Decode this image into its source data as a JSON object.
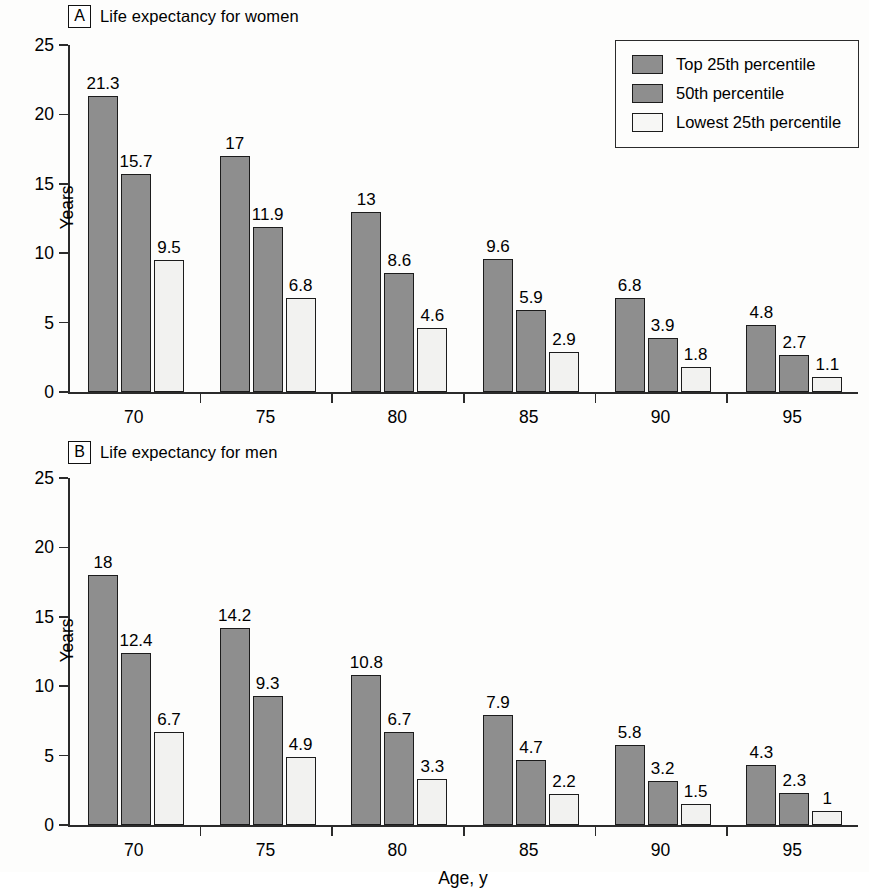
{
  "figure": {
    "background_color": "#fdfdfc",
    "axis_color": "#2b2b2b",
    "xlabel": "Age, y"
  },
  "legend": {
    "position": "top-right",
    "entries": [
      {
        "label": "Top 25th percentile",
        "color": "#8e8e8e"
      },
      {
        "label": "50th percentile",
        "color": "#8e8e8e"
      },
      {
        "label": "Lowest 25th percentile",
        "color": "#f2f2f0"
      }
    ]
  },
  "panels": [
    {
      "letter": "A",
      "title": "Life expectancy for women",
      "ylabel": "Years"
    },
    {
      "letter": "B",
      "title": "Life expectancy for men",
      "ylabel": "Years"
    }
  ],
  "yticks": [
    "0",
    "5",
    "10",
    "15",
    "20",
    "25"
  ],
  "xticks": [
    "70",
    "75",
    "80",
    "85",
    "90",
    "95"
  ],
  "chart_data": [
    {
      "type": "bar",
      "title": "A  Life expectancy for women",
      "xlabel": "",
      "ylabel": "Years",
      "ylim": [
        0,
        25
      ],
      "yticks": [
        0,
        5,
        10,
        15,
        20,
        25
      ],
      "grid": false,
      "legend_position": "upper right",
      "categories": [
        "70",
        "75",
        "80",
        "85",
        "90",
        "95"
      ],
      "series": [
        {
          "name": "Top 25th percentile",
          "color": "#8e8e8e",
          "values": [
            21.3,
            17,
            13,
            9.6,
            6.8,
            4.8
          ],
          "labels": [
            "21.3",
            "17",
            "13",
            "9.6",
            "6.8",
            "4.8"
          ]
        },
        {
          "name": "50th percentile",
          "color": "#8e8e8e",
          "values": [
            15.7,
            11.9,
            8.6,
            5.9,
            3.9,
            2.7
          ],
          "labels": [
            "15.7",
            "11.9",
            "8.6",
            "5.9",
            "3.9",
            "2.7"
          ]
        },
        {
          "name": "Lowest 25th percentile",
          "color": "#f2f2f0",
          "values": [
            9.5,
            6.8,
            4.6,
            2.9,
            1.8,
            1.1
          ],
          "labels": [
            "9.5",
            "6.8",
            "4.6",
            "2.9",
            "1.8",
            "1.1"
          ]
        }
      ]
    },
    {
      "type": "bar",
      "title": "B  Life expectancy for men",
      "xlabel": "Age, y",
      "ylabel": "Years",
      "ylim": [
        0,
        25
      ],
      "yticks": [
        0,
        5,
        10,
        15,
        20,
        25
      ],
      "grid": false,
      "legend_position": "none",
      "categories": [
        "70",
        "75",
        "80",
        "85",
        "90",
        "95"
      ],
      "series": [
        {
          "name": "Top 25th percentile",
          "color": "#8e8e8e",
          "values": [
            18,
            14.2,
            10.8,
            7.9,
            5.8,
            4.3
          ],
          "labels": [
            "18",
            "14.2",
            "10.8",
            "7.9",
            "5.8",
            "4.3"
          ]
        },
        {
          "name": "50th percentile",
          "color": "#8e8e8e",
          "values": [
            12.4,
            9.3,
            6.7,
            4.7,
            3.2,
            2.3
          ],
          "labels": [
            "12.4",
            "9.3",
            "6.7",
            "4.7",
            "3.2",
            "2.3"
          ]
        },
        {
          "name": "Lowest 25th percentile",
          "color": "#f2f2f0",
          "values": [
            6.7,
            4.9,
            3.3,
            2.2,
            1.5,
            1
          ],
          "labels": [
            "6.7",
            "4.9",
            "3.3",
            "2.2",
            "1.5",
            "1"
          ]
        }
      ]
    }
  ]
}
